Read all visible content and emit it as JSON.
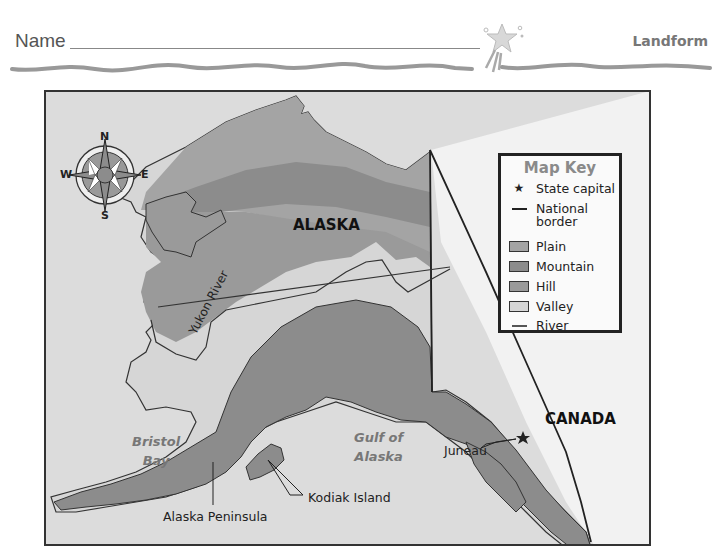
{
  "header": {
    "name_label": "Name",
    "topic_label": "Landform"
  },
  "map": {
    "region_labels": {
      "alaska": "ALASKA",
      "canada": "CANADA"
    },
    "water_labels": {
      "bristol_bay_line1": "Bristol",
      "bristol_bay_line2": "Bay",
      "gulf_line1": "Gulf of",
      "gulf_line2": "Alaska"
    },
    "feature_labels": {
      "yukon_river": "Yukon River",
      "juneau": "Juneau",
      "kodiak_island": "Kodiak Island",
      "alaska_peninsula": "Alaska Peninsula"
    },
    "compass": {
      "north": "N",
      "south": "S",
      "east": "E",
      "west": "W"
    },
    "colors": {
      "water": "#dcdcdc",
      "canada": "#f2f2f2",
      "plain": "#a4a4a4",
      "mountain": "#8c8c8c",
      "hill": "#9a9a9a",
      "valley": "#d6d6d6",
      "border": "#222222"
    }
  },
  "map_key": {
    "title": "Map Key",
    "items": [
      {
        "symbol": "star-icon",
        "label": "State capital"
      },
      {
        "symbol": "line-icon",
        "label_line1": "National",
        "label_line2": "border"
      },
      {
        "symbol": "swatch",
        "label": "Plain",
        "color": "#a4a4a4"
      },
      {
        "symbol": "swatch",
        "label": "Mountain",
        "color": "#8c8c8c"
      },
      {
        "symbol": "swatch",
        "label": "Hill",
        "color": "#9a9a9a"
      },
      {
        "symbol": "swatch",
        "label": "Valley",
        "color": "#d6d6d6"
      },
      {
        "symbol": "line-icon",
        "label": "River"
      }
    ]
  }
}
